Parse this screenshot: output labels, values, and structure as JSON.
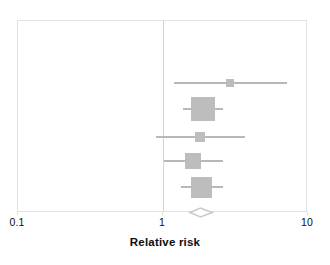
{
  "chart_data": {
    "type": "forest",
    "title": "",
    "xlabel": "Relative risk",
    "ylabel": "",
    "scale": "log10",
    "xlim": [
      0.1,
      10
    ],
    "null_value": 1,
    "grid": false,
    "legend": "none",
    "tick_labels": [
      "0.1",
      "1",
      "10"
    ],
    "tick_values": [
      0.1,
      1,
      10
    ],
    "studies": [
      {
        "label": "",
        "rr": 2.9,
        "ci_low": 1.19,
        "ci_high": 7.2,
        "weight_marker_px": 8
      },
      {
        "label": "",
        "rr": 1.9,
        "ci_low": 1.37,
        "ci_high": 2.6,
        "weight_marker_px": 24
      },
      {
        "label": "",
        "rr": 1.8,
        "ci_low": 0.9,
        "ci_high": 3.7,
        "weight_marker_px": 10
      },
      {
        "label": "",
        "rr": 1.6,
        "ci_low": 1.02,
        "ci_high": 2.6,
        "weight_marker_px": 16
      },
      {
        "label": "",
        "rr": 1.85,
        "ci_low": 1.32,
        "ci_high": 2.6,
        "weight_marker_px": 21
      }
    ],
    "summary": {
      "label": "",
      "rr": 1.8,
      "ci_low": 1.5,
      "ci_high": 2.2
    },
    "colors": {
      "marker": "#bdbdbd",
      "ci_line": "#b8b8b8",
      "null_line": "#d4d4d4",
      "frame": "#e2e2e2",
      "diamond_stroke": "#c9c9c9",
      "diamond_fill": "#ffffff",
      "text": "#0d0d0d",
      "background": "#ffffff"
    }
  }
}
